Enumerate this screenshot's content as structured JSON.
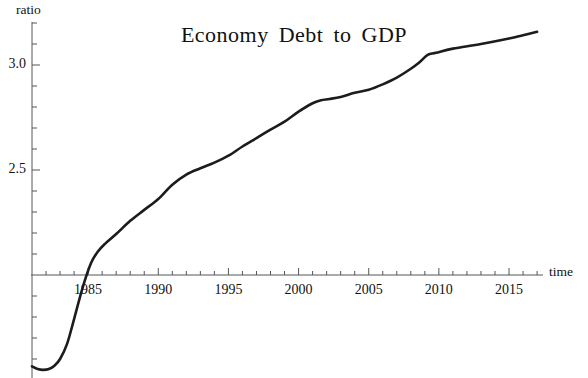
{
  "chart_data": {
    "type": "line",
    "title": "Economy  Debt  to  GDP",
    "xlabel": "time",
    "ylabel": "ratio",
    "grid": false,
    "legend": null,
    "xlim": [
      1981,
      1987.7
    ],
    "ylim": [
      1.54,
      3.22
    ],
    "x_axis_crosses_y_at": 2.0,
    "y_axis_crosses_x_at": 1981,
    "xticks_major": [
      1985,
      1990,
      1995,
      2000,
      2005,
      2010,
      2015
    ],
    "xtick_labels": [
      "1985",
      "1990",
      "1995",
      "2000",
      "2005",
      "2010",
      "2015"
    ],
    "xticks_minor_step": 1,
    "yticks_major": [
      2.5,
      3.0
    ],
    "ytick_labels": [
      "2.5",
      "3.0"
    ],
    "yticks_minor_step": 0.1,
    "series": [
      {
        "name": "Economy Debt to GDP",
        "color": "#1c1c1c",
        "x": [
          1981.0,
          1981.4,
          1981.8,
          1982.2,
          1982.6,
          1983.0,
          1983.5,
          1984.0,
          1984.6,
          1985.2,
          1985.7,
          1986.2,
          1987.0,
          1988.0,
          1989.0,
          1990.0,
          1991.0,
          1992.0,
          1993.0,
          1994.0,
          1995.0,
          1996.0,
          1997.0,
          1998.0,
          1999.0,
          2000.0,
          2001.0,
          2001.6,
          2002.2,
          2003.0,
          2004.0,
          2005.0,
          2006.0,
          2007.0,
          2008.0,
          2008.6,
          2009.2,
          2009.8,
          2011.0,
          2013.0,
          2015.0,
          2016.0,
          2017.0
        ],
        "y": [
          1.565,
          1.552,
          1.548,
          1.552,
          1.568,
          1.6,
          1.672,
          1.79,
          1.938,
          2.056,
          2.112,
          2.148,
          2.195,
          2.258,
          2.31,
          2.362,
          2.43,
          2.478,
          2.508,
          2.535,
          2.568,
          2.612,
          2.652,
          2.692,
          2.73,
          2.778,
          2.818,
          2.832,
          2.838,
          2.848,
          2.868,
          2.882,
          2.908,
          2.94,
          2.982,
          3.012,
          3.048,
          3.058,
          3.078,
          3.1,
          3.126,
          3.142,
          3.158
        ]
      }
    ]
  },
  "axes": {
    "y_title": "ratio",
    "x_title": "time"
  }
}
